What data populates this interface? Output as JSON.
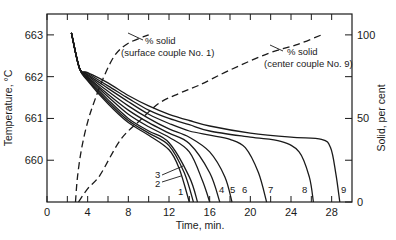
{
  "chart_data": {
    "type": "line",
    "title": "",
    "xlabel": "Time, min.",
    "ylabel": "Temperature, °C",
    "y2label": "Solid, per cent",
    "xlim": [
      0,
      30
    ],
    "ylim": [
      659.0,
      663.5
    ],
    "y2lim": [
      0,
      100
    ],
    "grid": false,
    "x_ticks": [
      0,
      4,
      8,
      12,
      16,
      20,
      24,
      28
    ],
    "x_minor_ticks": [
      2,
      6,
      10,
      14,
      18,
      22,
      26
    ],
    "y_ticks": [
      660,
      661,
      662,
      663
    ],
    "y2_ticks": [
      0,
      50,
      100
    ],
    "y2_minor_ticks": [
      25,
      75
    ],
    "cooling_curves": [
      {
        "name": "1",
        "points": [
          [
            2.4,
            663.05
          ],
          [
            3.2,
            662.2
          ],
          [
            4,
            661.9
          ],
          [
            6,
            661.35
          ],
          [
            8,
            660.9
          ],
          [
            10,
            660.6
          ],
          [
            12,
            660.25
          ],
          [
            13,
            659.8
          ],
          [
            14.0,
            659.0
          ]
        ]
      },
      {
        "name": "2",
        "points": [
          [
            2.4,
            663.05
          ],
          [
            3.2,
            662.2
          ],
          [
            4,
            661.92
          ],
          [
            6,
            661.4
          ],
          [
            8,
            660.95
          ],
          [
            10,
            660.65
          ],
          [
            12,
            660.35
          ],
          [
            13.5,
            659.7
          ],
          [
            14.4,
            659.0
          ]
        ]
      },
      {
        "name": "3",
        "points": [
          [
            2.4,
            663.05
          ],
          [
            3.2,
            662.2
          ],
          [
            4,
            661.95
          ],
          [
            6,
            661.45
          ],
          [
            8,
            661.0
          ],
          [
            10,
            660.7
          ],
          [
            12,
            660.42
          ],
          [
            14,
            659.6
          ],
          [
            14.8,
            659.0
          ]
        ]
      },
      {
        "name": "4",
        "points": [
          [
            2.4,
            663.05
          ],
          [
            3.2,
            662.2
          ],
          [
            4,
            661.98
          ],
          [
            6,
            661.52
          ],
          [
            8,
            661.1
          ],
          [
            10,
            660.8
          ],
          [
            12,
            660.55
          ],
          [
            14,
            660.2
          ],
          [
            15.3,
            659.5
          ],
          [
            16.0,
            659.0
          ]
        ]
      },
      {
        "name": "5",
        "points": [
          [
            2.4,
            663.05
          ],
          [
            3.2,
            662.2
          ],
          [
            4,
            662.0
          ],
          [
            6,
            661.58
          ],
          [
            8,
            661.2
          ],
          [
            10,
            660.9
          ],
          [
            12,
            660.65
          ],
          [
            14,
            660.4
          ],
          [
            16,
            659.7
          ],
          [
            17.0,
            659.0
          ]
        ]
      },
      {
        "name": "6",
        "points": [
          [
            2.4,
            663.05
          ],
          [
            3.2,
            662.2
          ],
          [
            4,
            662.03
          ],
          [
            6,
            661.65
          ],
          [
            8,
            661.3
          ],
          [
            10,
            661.0
          ],
          [
            12,
            660.75
          ],
          [
            14,
            660.55
          ],
          [
            16,
            660.2
          ],
          [
            17.5,
            659.6
          ],
          [
            18.2,
            659.0
          ]
        ]
      },
      {
        "name": "7",
        "points": [
          [
            2.4,
            663.05
          ],
          [
            3.2,
            662.2
          ],
          [
            4,
            662.05
          ],
          [
            6,
            661.72
          ],
          [
            8,
            661.4
          ],
          [
            10,
            661.1
          ],
          [
            12,
            660.88
          ],
          [
            14,
            660.7
          ],
          [
            16,
            660.6
          ],
          [
            18,
            660.5
          ],
          [
            19.5,
            660.3
          ],
          [
            20.8,
            659.7
          ],
          [
            21.6,
            659.0
          ]
        ]
      },
      {
        "name": "8",
        "points": [
          [
            2.4,
            663.05
          ],
          [
            3.2,
            662.2
          ],
          [
            4,
            662.08
          ],
          [
            6,
            661.78
          ],
          [
            8,
            661.48
          ],
          [
            10,
            661.2
          ],
          [
            12,
            661.0
          ],
          [
            14,
            660.85
          ],
          [
            16,
            660.7
          ],
          [
            20,
            660.55
          ],
          [
            23,
            660.45
          ],
          [
            24.8,
            660.2
          ],
          [
            25.8,
            659.6
          ],
          [
            26.2,
            659.0
          ]
        ]
      },
      {
        "name": "9",
        "points": [
          [
            2.4,
            663.05
          ],
          [
            3.2,
            662.2
          ],
          [
            4,
            662.1
          ],
          [
            6,
            661.85
          ],
          [
            8,
            661.55
          ],
          [
            10,
            661.3
          ],
          [
            12,
            661.1
          ],
          [
            14,
            660.95
          ],
          [
            16,
            660.82
          ],
          [
            20,
            660.65
          ],
          [
            24,
            660.55
          ],
          [
            27,
            660.5
          ],
          [
            27.9,
            660.3
          ],
          [
            28.4,
            659.7
          ],
          [
            28.8,
            659.0
          ]
        ]
      }
    ],
    "solid_fraction_curves": [
      {
        "name": "% solid (surface couple No. 1)",
        "style": "dashed",
        "axis": "right",
        "points": [
          [
            2.8,
            0
          ],
          [
            3.0,
            15
          ],
          [
            3.4,
            32
          ],
          [
            4.0,
            48
          ],
          [
            4.7,
            61
          ],
          [
            5.6,
            75
          ],
          [
            6.7,
            88
          ],
          [
            8.0,
            95
          ],
          [
            10.0,
            100
          ]
        ]
      },
      {
        "name": "% solid (center couple No. 9)",
        "style": "dashed",
        "axis": "right",
        "points": [
          [
            3.1,
            0
          ],
          [
            4.0,
            8
          ],
          [
            5.2,
            16
          ],
          [
            7.2,
            37
          ],
          [
            9.0,
            48
          ],
          [
            11.0,
            59
          ],
          [
            13.0,
            65
          ],
          [
            15.0,
            70
          ],
          [
            18.0,
            79
          ],
          [
            21.8,
            89
          ],
          [
            24.5,
            94
          ],
          [
            27.0,
            100
          ]
        ]
      }
    ],
    "annotations": [
      {
        "line1": "% solid",
        "line2": "(surface couple No. 1)"
      },
      {
        "line1": "% solid",
        "line2": "(center couple No. 9)"
      }
    ]
  }
}
